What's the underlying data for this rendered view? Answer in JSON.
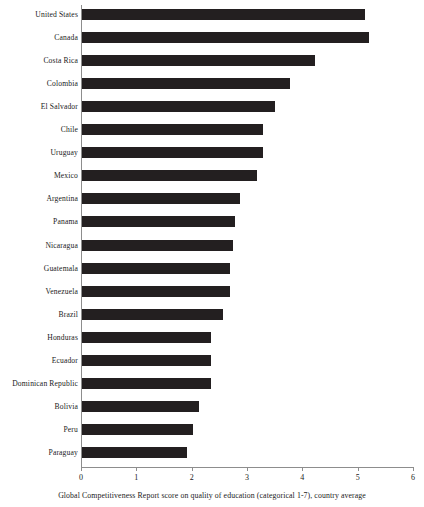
{
  "chart_data": {
    "type": "bar",
    "orientation": "horizontal",
    "title": "",
    "xlabel": "Global Competitiveness Report score on quality of education (categorical 1-7), country average",
    "ylabel": "",
    "xlim": [
      0,
      6
    ],
    "xticks": [
      "0",
      "1",
      "2",
      "3",
      "4",
      "5",
      "6"
    ],
    "grid": false,
    "legend": null,
    "bar_color": "#231f20",
    "axis_color": "#8d8d8d",
    "categories": [
      "United States",
      "Canada",
      "Costa Rica",
      "Colombia",
      "El Salvador",
      "Chile",
      "Uruguay",
      "Mexico",
      "Argentina",
      "Panama",
      "Nicaragua",
      "Guatemala",
      "Venezuela",
      "Brazil",
      "Honduras",
      "Ecuador",
      "Dominican Republic",
      "Bolivia",
      "Peru",
      "Paraguay"
    ],
    "values": [
      5.12,
      5.19,
      4.21,
      3.76,
      3.49,
      3.27,
      3.27,
      3.17,
      2.86,
      2.77,
      2.73,
      2.68,
      2.68,
      2.55,
      2.33,
      2.33,
      2.33,
      2.11,
      2.0,
      1.9
    ]
  },
  "page": {
    "artifact_mark": ""
  }
}
